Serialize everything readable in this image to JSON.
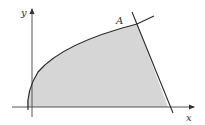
{
  "diagram": {
    "type": "region-bounded-by-curve-and-line",
    "labels": {
      "x_axis": "x",
      "y_axis": "y",
      "point": "A"
    },
    "colors": {
      "stroke": "#2a2a2a",
      "shade": "#d6d6d6",
      "axis": "#555555"
    }
  }
}
